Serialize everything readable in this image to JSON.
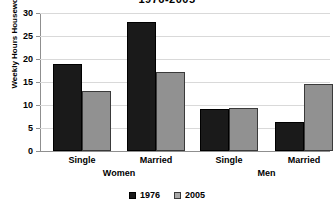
{
  "chart_data": {
    "type": "bar",
    "title": "1976-2005",
    "xlabel": "",
    "ylabel": "Weekly Hours Housework",
    "ylim": [
      0,
      30
    ],
    "yticks": [
      0,
      5,
      10,
      15,
      20,
      25,
      30
    ],
    "grid": true,
    "legend_position": "bottom-center",
    "categories": [
      "Single",
      "Married",
      "Single",
      "Married"
    ],
    "groups": [
      {
        "name": "Women",
        "categories": [
          "Single",
          "Married"
        ]
      },
      {
        "name": "Men",
        "categories": [
          "Single",
          "Married"
        ]
      }
    ],
    "series": [
      {
        "name": "1976",
        "color": "#1a1a1a",
        "values": [
          19.0,
          28.0,
          9.2,
          6.2
        ]
      },
      {
        "name": "2005",
        "color": "#919191",
        "values": [
          13.0,
          17.2,
          9.3,
          14.5
        ]
      }
    ]
  },
  "axis": {
    "y_title": "Weekly Hours Housework",
    "ticks": [
      "30",
      "25",
      "20",
      "15",
      "10",
      "5",
      "0"
    ]
  },
  "categories": {
    "women_single": "Single",
    "women_married": "Married",
    "men_single": "Single",
    "men_married": "Married"
  },
  "groups": {
    "women": "Women",
    "men": "Men"
  },
  "legend": {
    "items": [
      {
        "label": "1976"
      },
      {
        "label": "2005"
      }
    ]
  },
  "title": "1976-2005"
}
